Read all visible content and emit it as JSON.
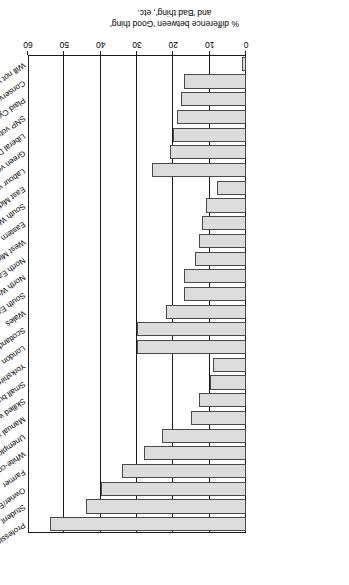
{
  "chart_data": {
    "type": "bar",
    "orientation": "horizontal",
    "title": "",
    "xlabel": "",
    "ylabel": "% difference between 'Good thing' and 'Bad thing', etc.",
    "value_axis_label_line1": "% difference between 'Good thing'",
    "value_axis_label_line2": "and 'Bad thing', etc.",
    "xlim": [
      0,
      60
    ],
    "ticks": [
      0,
      10,
      20,
      30,
      40,
      50,
      60
    ],
    "grid": true,
    "legend": "none",
    "bar_fill": "#dcdcdc",
    "bar_edge": "#4a4a4a",
    "axis_color": "#1a1a1a",
    "rotated_180": true,
    "categories": [
      "Professional",
      "Student",
      "Owner/Employer",
      "Farmer",
      "White-collar employee",
      "Unemployed",
      "Manual worker",
      "Skilled worker",
      "Small business owner",
      "Yorkshire and Humber",
      "London",
      "Scotland",
      "Wales",
      "South East",
      "North West",
      "North East",
      "West Midlands",
      "Eastern",
      "South West",
      "East Midlands",
      "Labour voter",
      "Green voter",
      "Liberal Democrat voter",
      "SNP voter",
      "Plaid Cymru (PC) voter",
      "Conservative voter",
      "Will not vote"
    ],
    "values": [
      54,
      44,
      40,
      34,
      28,
      23,
      15,
      13,
      10,
      9,
      30,
      30,
      22,
      17,
      17,
      14,
      13,
      12,
      11,
      8,
      26,
      21,
      20,
      19,
      18,
      17,
      1
    ]
  }
}
